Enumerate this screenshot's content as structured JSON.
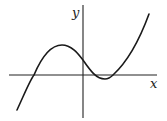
{
  "figure": {
    "x_axis_label": "x",
    "y_axis_label": "y",
    "colors": {
      "axes": "#222222",
      "curve": "#1a1a1a",
      "background": "#ffffff"
    }
  }
}
